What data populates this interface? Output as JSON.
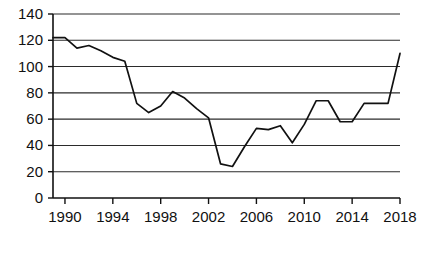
{
  "chart_data": {
    "type": "line",
    "title": "",
    "subtitle": "",
    "xlabel": "",
    "ylabel": "",
    "xlim": [
      1989,
      2018
    ],
    "ylim": [
      0,
      140
    ],
    "grid": true,
    "legend": false,
    "legend_position": "none",
    "y_ticks": [
      0,
      20,
      40,
      60,
      80,
      100,
      120,
      140
    ],
    "y_tick_labels": [
      "0",
      "20",
      "40",
      "60",
      "80",
      "100",
      "120",
      "140"
    ],
    "x_ticks": [
      1990,
      1994,
      1998,
      2002,
      2006,
      2010,
      2014,
      2018
    ],
    "x_tick_labels": [
      "1990",
      "1994",
      "1998",
      "2002",
      "2006",
      "2010",
      "2014",
      "2018"
    ],
    "line_color": "#111111",
    "grid_color": "#2b2b2b",
    "axis_color": "#111111",
    "x": [
      1989,
      1990,
      1991,
      1992,
      1993,
      1994,
      1995,
      1996,
      1997,
      1998,
      1999,
      2000,
      2001,
      2002,
      2003,
      2004,
      2005,
      2006,
      2007,
      2008,
      2009,
      2010,
      2011,
      2012,
      2013,
      2014,
      2015,
      2016,
      2017,
      2018
    ],
    "values": [
      122,
      122,
      114,
      116,
      112,
      107,
      104,
      72,
      65,
      70,
      81,
      76,
      68,
      61,
      26,
      24,
      39,
      53,
      52,
      55,
      42,
      56,
      74,
      74,
      58,
      58,
      72,
      72,
      72,
      110
    ],
    "series": [
      {
        "name": "series-1",
        "values": [
          122,
          122,
          114,
          116,
          112,
          107,
          104,
          72,
          65,
          70,
          81,
          76,
          68,
          61,
          26,
          24,
          39,
          53,
          52,
          55,
          42,
          56,
          74,
          74,
          58,
          58,
          72,
          72,
          72,
          110
        ]
      }
    ]
  },
  "plot_geometry": {
    "left": 53,
    "right": 400,
    "top": 14,
    "bottom": 198
  }
}
